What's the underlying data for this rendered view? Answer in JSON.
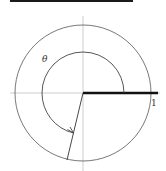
{
  "diagram": {
    "labels": {
      "theta": "θ",
      "one": "1"
    },
    "colors": {
      "top_bar": "#1a1a1a",
      "circle": "#555555",
      "axes": "#bbbbbb",
      "thick_ray": "#111111",
      "ray": "#333333",
      "arc": "#444444"
    }
  }
}
